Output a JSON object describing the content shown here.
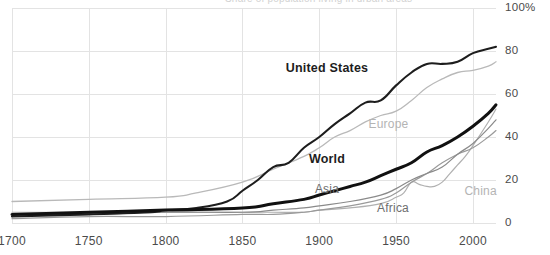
{
  "chart_data": {
    "type": "line",
    "title": "Share of population living in urban areas",
    "xlabel": "",
    "ylabel": "",
    "xlim": [
      1700,
      2015
    ],
    "ylim": [
      0,
      100
    ],
    "grid": true,
    "legend_position": "inline-annotations",
    "x_ticks": [
      "1700",
      "1750",
      "1800",
      "1850",
      "1900",
      "1950",
      "2000"
    ],
    "x_tick_values": [
      1700,
      1750,
      1800,
      1850,
      1900,
      1950,
      2000
    ],
    "y_ticks": [
      "0",
      "20",
      "40",
      "60",
      "80",
      "100%"
    ],
    "y_tick_values": [
      0,
      20,
      40,
      60,
      80,
      100
    ],
    "series": [
      {
        "name": "United States",
        "color": "#1d1d1d",
        "width": 2.1,
        "label_x": 1905,
        "label_y": 72,
        "x": [
          1700,
          1750,
          1790,
          1800,
          1820,
          1840,
          1850,
          1860,
          1870,
          1880,
          1890,
          1900,
          1910,
          1920,
          1930,
          1940,
          1950,
          1960,
          1970,
          1980,
          1990,
          2000,
          2010,
          2015
        ],
        "values": [
          3,
          4,
          5,
          6,
          7,
          10,
          15,
          20,
          26,
          28,
          35,
          40,
          46,
          51,
          56,
          57,
          64,
          70,
          74,
          74,
          75,
          79,
          81,
          82
        ]
      },
      {
        "name": "Europe",
        "color": "#b9b9b9",
        "width": 1.3,
        "label_x": 1945,
        "label_y": 46,
        "x": [
          1700,
          1750,
          1800,
          1820,
          1850,
          1870,
          1890,
          1900,
          1910,
          1920,
          1930,
          1940,
          1950,
          1960,
          1970,
          1980,
          1990,
          2000,
          2010,
          2015
        ],
        "values": [
          10,
          11,
          12,
          14,
          19,
          25,
          31,
          35,
          40,
          43,
          47,
          50,
          52,
          57,
          63,
          67,
          70,
          71,
          73,
          75
        ]
      },
      {
        "name": "World",
        "color": "#111111",
        "width": 3.0,
        "label_x": 1905,
        "label_y": 30,
        "x": [
          1700,
          1750,
          1800,
          1850,
          1870,
          1890,
          1900,
          1910,
          1920,
          1930,
          1940,
          1950,
          1960,
          1970,
          1980,
          1990,
          2000,
          2010,
          2015
        ],
        "values": [
          4,
          5,
          6,
          7,
          9,
          11,
          13,
          15,
          17,
          19,
          22,
          25,
          28,
          33,
          36,
          40,
          45,
          51,
          55
        ]
      },
      {
        "name": "Asia",
        "color": "#8a8a8a",
        "width": 1.2,
        "label_x": 1905,
        "label_y": 16,
        "x": [
          1700,
          1750,
          1800,
          1850,
          1870,
          1890,
          1900,
          1920,
          1940,
          1950,
          1960,
          1970,
          1980,
          1990,
          2000,
          2010,
          2015
        ],
        "values": [
          4,
          4,
          5,
          5,
          6,
          7,
          8,
          10,
          13,
          16,
          20,
          23,
          26,
          32,
          37,
          44,
          48
        ]
      },
      {
        "name": "Africa",
        "color": "#9a9a9a",
        "width": 1.2,
        "label_x": 1948,
        "label_y": 7,
        "x": [
          1700,
          1750,
          1800,
          1850,
          1870,
          1890,
          1900,
          1920,
          1940,
          1950,
          1960,
          1970,
          1980,
          1990,
          2000,
          2010,
          2015
        ],
        "values": [
          2,
          3,
          3,
          4,
          4,
          5,
          6,
          8,
          11,
          14,
          19,
          23,
          28,
          32,
          35,
          40,
          43
        ]
      },
      {
        "name": "China",
        "color": "#b0b0b0",
        "width": 1.2,
        "label_x": 2005,
        "label_y": 15,
        "x": [
          1700,
          1750,
          1800,
          1850,
          1870,
          1890,
          1900,
          1920,
          1940,
          1950,
          1955,
          1960,
          1965,
          1970,
          1975,
          1980,
          1985,
          1990,
          1995,
          2000,
          2010,
          2015
        ],
        "values": [
          5,
          5,
          5,
          5,
          5,
          5,
          6,
          7,
          9,
          12,
          14,
          19,
          18,
          17,
          17,
          19,
          23,
          27,
          31,
          36,
          47,
          53
        ]
      }
    ]
  },
  "axis": {
    "y_unit_label": "100%"
  }
}
